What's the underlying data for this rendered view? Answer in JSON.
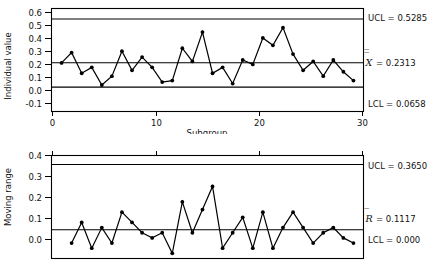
{
  "chart_data": [
    {
      "type": "line",
      "name": "individuals-chart",
      "title": "",
      "xlabel": "Subgroup",
      "ylabel": "Individual value",
      "xlim": [
        0,
        31
      ],
      "ylim": [
        -0.1,
        0.6
      ],
      "xticks": [
        0,
        10,
        20,
        30
      ],
      "xtick_labels": [
        "0",
        "10",
        "20",
        "30"
      ],
      "yticks": [
        -0.1,
        0.0,
        0.1,
        0.2,
        0.3,
        0.4,
        0.5,
        0.6
      ],
      "ytick_labels": [
        "-0.1",
        "0.0",
        "0.1",
        "0.2",
        "0.3",
        "0.4",
        "0.5",
        "0.6"
      ],
      "grid": false,
      "legend": "none",
      "x": [
        1,
        2,
        3,
        4,
        5,
        6,
        7,
        8,
        9,
        10,
        11,
        12,
        13,
        14,
        15,
        16,
        17,
        18,
        19,
        20,
        21,
        22,
        23,
        24,
        25,
        26,
        27,
        28,
        29,
        30
      ],
      "values": [
        0.23,
        0.3,
        0.16,
        0.2,
        0.08,
        0.14,
        0.31,
        0.18,
        0.27,
        0.2,
        0.1,
        0.11,
        0.33,
        0.24,
        0.44,
        0.16,
        0.2,
        0.09,
        0.25,
        0.22,
        0.4,
        0.35,
        0.47,
        0.29,
        0.18,
        0.24,
        0.14,
        0.25,
        0.17,
        0.11
      ],
      "control_lines": [
        {
          "name": "UCL",
          "label": "UCL = 0.5285",
          "value": 0.5285
        },
        {
          "name": "CL",
          "label": "= 0.2313",
          "symbol": "X",
          "symbol_overbar": "double",
          "value": 0.2313
        },
        {
          "name": "LCL",
          "label": "LCL = 0.0658",
          "value": 0.0658
        }
      ]
    },
    {
      "type": "line",
      "name": "moving-range-chart",
      "title": "",
      "xlabel": "",
      "ylabel": "Moving range",
      "xlim": [
        0,
        31
      ],
      "ylim": [
        0.0,
        0.4
      ],
      "xticks": [
        0,
        10,
        20,
        30
      ],
      "xtick_labels": [
        "",
        "",
        "",
        ""
      ],
      "yticks": [
        0.0,
        0.1,
        0.2,
        0.3,
        0.4
      ],
      "ytick_labels": [
        "0.0",
        "0.1",
        "0.2",
        "0.3",
        "0.4"
      ],
      "grid": false,
      "legend": "none",
      "x": [
        2,
        3,
        4,
        5,
        6,
        7,
        8,
        9,
        10,
        11,
        12,
        13,
        14,
        15,
        16,
        17,
        18,
        19,
        20,
        21,
        22,
        23,
        24,
        25,
        26,
        27,
        28,
        29,
        30
      ],
      "values": [
        0.06,
        0.14,
        0.04,
        0.12,
        0.06,
        0.18,
        0.14,
        0.1,
        0.08,
        0.1,
        0.02,
        0.22,
        0.1,
        0.19,
        0.28,
        0.04,
        0.1,
        0.16,
        0.04,
        0.18,
        0.04,
        0.12,
        0.18,
        0.12,
        0.06,
        0.1,
        0.12,
        0.08,
        0.06
      ],
      "control_lines": [
        {
          "name": "UCL",
          "label": "UCL = 0.3650",
          "value": 0.365
        },
        {
          "name": "CL",
          "label": "= 0.1117",
          "symbol": "R",
          "symbol_overbar": "single",
          "value": 0.1117
        },
        {
          "name": "LCL",
          "label": "LCL = 0.000",
          "value": 0.0
        }
      ]
    }
  ]
}
